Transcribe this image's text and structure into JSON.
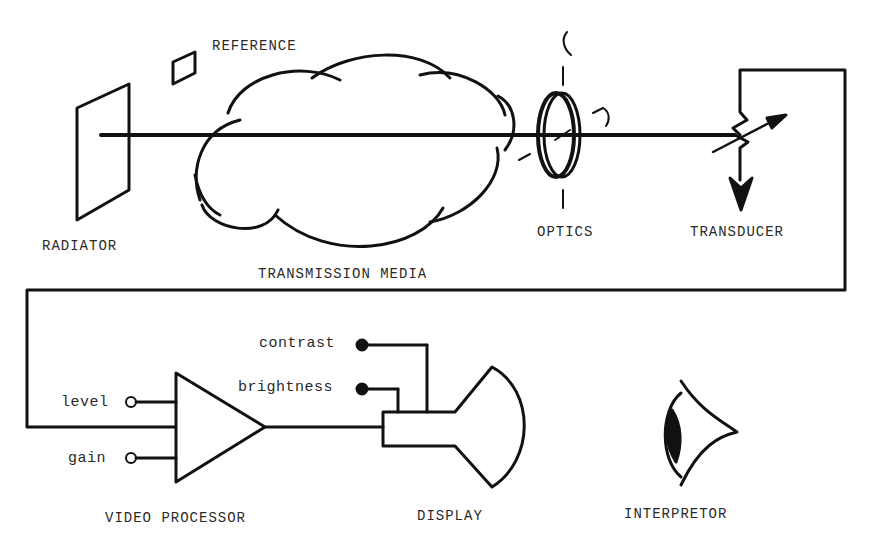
{
  "diagram": {
    "stroke_color": "#111111",
    "text_color": "#2a2a2a",
    "labels": {
      "reference": "REFERENCE",
      "radiator": "RADIATOR",
      "transmission_media": "TRANSMISSION MEDIA",
      "optics": "OPTICS",
      "transducer": "TRANSDUCER",
      "video_processor": "VIDEO PROCESSOR",
      "display": "DISPLAY",
      "interpretor": "INTERPRETOR"
    },
    "controls": {
      "contrast": "contrast",
      "brightness": "brightness",
      "level": "level",
      "gain": "gain"
    },
    "icons": [
      "radiator-plate-icon",
      "reference-plate-icon",
      "cloud-icon",
      "lens-icon",
      "transducer-variable-resistor-icon",
      "ground-arrow-icon",
      "amplifier-triangle-icon",
      "crt-display-icon",
      "eye-icon"
    ]
  }
}
